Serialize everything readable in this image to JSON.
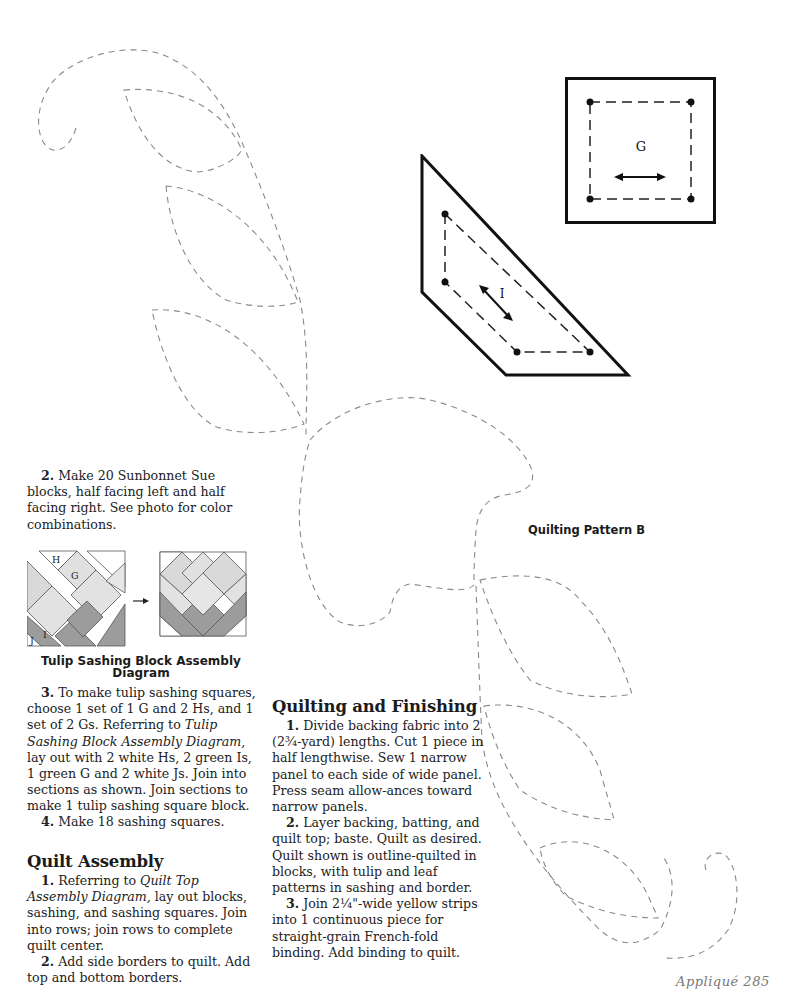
{
  "page": {
    "folio": "Appliqué 285",
    "pattern_label": "Quilting Pattern B"
  },
  "templates": {
    "square": {
      "label": "G",
      "grain_arrow": "horizontal"
    },
    "trapezoid": {
      "label": "I",
      "grain_arrow": "diagonal"
    }
  },
  "step2": {
    "num": "2.",
    "text": " Make 20 Sunbonnet Sue blocks, half facing left and half facing right. See photo for color combinations."
  },
  "diagram": {
    "labels": {
      "h": "H",
      "g": "G",
      "i": "I",
      "j": "J"
    },
    "arrow": "→",
    "caption_line1": "Tulip Sashing Block Assembly",
    "caption_line2": "Diagram",
    "colors": {
      "light": "#d9d9d9",
      "lighter": "#e6e6e6",
      "dark": "#9c9c9c",
      "white": "#ffffff",
      "outline": "#555555"
    }
  },
  "step3": {
    "num": "3.",
    "text_a": " To make tulip sashing squares, choose 1 set of 1 G and 2 Hs, and 1 set of 2 Gs. Referring to ",
    "italic": "Tulip Sashing Block Assembly Diagram,",
    "text_b": " lay out with 2 white Hs, 2 green Is, 1 green G and 2 white Js. Join into sections as shown. Join sections to make 1 tulip sashing square block."
  },
  "step4": {
    "num": "4.",
    "text": " Make 18 sashing squares."
  },
  "quilt_assembly": {
    "heading": "Quilt Assembly",
    "steps": [
      {
        "num": "1.",
        "text_a": " Referring to ",
        "italic": "Quilt Top Assembly Diagram,",
        "text_b": " lay out blocks, sashing, and sashing squares. Join into rows; join rows to complete quilt center."
      },
      {
        "num": "2.",
        "text": " Add side borders to quilt. Add top and bottom borders."
      }
    ]
  },
  "quilting_finishing": {
    "heading": "Quilting and Finishing",
    "steps": [
      {
        "num": "1.",
        "text": " Divide backing fabric into 2 (2¾-yard) lengths. Cut 1 piece in half lengthwise. Sew 1 narrow panel to each side of wide panel. Press seam allow-ances toward narrow panels."
      },
      {
        "num": "2.",
        "text": " Layer backing, batting, and quilt top; baste. Quilt as desired. Quilt shown is outline-quilted in blocks, with tulip and leaf patterns in sashing and border."
      },
      {
        "num": "3.",
        "text": " Join 2¼\"-wide yellow strips into 1 continuous piece for straight-grain French-fold binding. Add binding to quilt."
      }
    ]
  }
}
